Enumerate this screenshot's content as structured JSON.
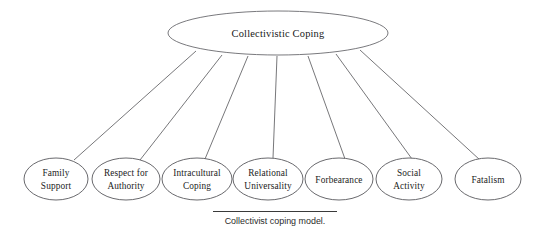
{
  "figure": {
    "type": "hierarchy-diagram",
    "caption": "Collectivist coping model.",
    "root": {
      "label": "Collectivistic Coping",
      "cx": 278,
      "cy": 33,
      "rx": 110,
      "ry": 22
    },
    "nodes": [
      {
        "label": "Family Support",
        "line1": "Family",
        "line2": "Support",
        "cx": 56,
        "cy": 179,
        "rx": 32,
        "ry": 21
      },
      {
        "label": "Respect for Authority",
        "line1": "Respect for",
        "line2": "Authority",
        "cx": 126,
        "cy": 179,
        "rx": 34,
        "ry": 21
      },
      {
        "label": "Intracultural Coping",
        "line1": "Intracultural",
        "line2": "Coping",
        "cx": 197,
        "cy": 179,
        "rx": 35,
        "ry": 21
      },
      {
        "label": "Relational Universality",
        "line1": "Relational",
        "line2": "Universality",
        "cx": 268,
        "cy": 179,
        "rx": 35,
        "ry": 21
      },
      {
        "label": "Forbearance",
        "line1": "Forbearance",
        "line2": "",
        "cx": 339,
        "cy": 179,
        "rx": 34,
        "ry": 21
      },
      {
        "label": "Social Activity",
        "line1": "Social",
        "line2": "Activity",
        "cx": 409,
        "cy": 179,
        "rx": 33,
        "ry": 21
      },
      {
        "label": "Fatalism",
        "line1": "Fatalism",
        "line2": "",
        "cx": 488,
        "cy": 179,
        "rx": 33,
        "ry": 21
      }
    ],
    "edges": [
      {
        "from": "Collectivistic Coping",
        "to": "Family Support",
        "x1": 196,
        "y1": 51,
        "x2": 74,
        "y2": 160
      },
      {
        "from": "Collectivistic Coping",
        "to": "Respect for Authority",
        "x1": 222,
        "y1": 55,
        "x2": 140,
        "y2": 160
      },
      {
        "from": "Collectivistic Coping",
        "to": "Intracultural Coping",
        "x1": 248,
        "y1": 56,
        "x2": 205,
        "y2": 159
      },
      {
        "from": "Collectivistic Coping",
        "to": "Relational Universality",
        "x1": 277,
        "y1": 56,
        "x2": 273,
        "y2": 158
      },
      {
        "from": "Collectivistic Coping",
        "to": "Forbearance",
        "x1": 308,
        "y1": 56,
        "x2": 345,
        "y2": 159
      },
      {
        "from": "Collectivistic Coping",
        "to": "Social Activity",
        "x1": 336,
        "y1": 54,
        "x2": 412,
        "y2": 159
      },
      {
        "from": "Collectivistic Coping",
        "to": "Fatalism",
        "x1": 360,
        "y1": 50,
        "x2": 480,
        "y2": 160
      }
    ],
    "colors": {
      "background": "#ffffff",
      "stroke": "#58585c",
      "text": "#1a1a1a",
      "caption_text": "#2b2b2b",
      "caption_rule": "#3a3a3a"
    }
  }
}
